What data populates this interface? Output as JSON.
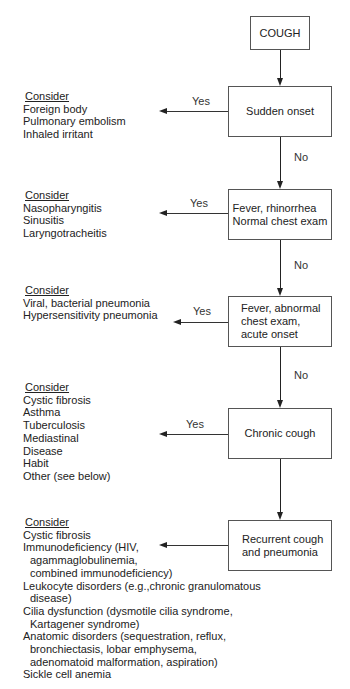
{
  "title": "COUGH",
  "nodes": [
    {
      "id": "cough",
      "label": "COUGH"
    },
    {
      "id": "sudden-onset",
      "label": "Sudden onset"
    },
    {
      "id": "fever-rhinorrhea",
      "label": "Fever, rhinorrhea\nNormal chest exam"
    },
    {
      "id": "fever-abnormal",
      "label": "Fever, abnormal\nchest  exam,\nacute onset"
    },
    {
      "id": "chronic-cough",
      "label": "Chronic cough"
    },
    {
      "id": "recurrent-cough",
      "label": "Recurrent cough\nand pneumonia"
    }
  ],
  "edge_labels": {
    "yes": "Yes",
    "no": "No"
  },
  "consider_groups": [
    {
      "heading": "Consider",
      "items": [
        "Foreign body",
        "Pulmonary embolism",
        "Inhaled irritant"
      ]
    },
    {
      "heading": "Consider",
      "items": [
        "Nasopharyngitis",
        "Sinusitis",
        "Laryngotracheitis"
      ]
    },
    {
      "heading": "Consider",
      "items": [
        "Viral, bacterial pneumonia",
        "Hypersensitivity pneumonia"
      ]
    },
    {
      "heading": "Consider",
      "items": [
        "Cystic fibrosis",
        "Asthma",
        "Tuberculosis",
        "Mediastinal",
        "Disease",
        "Habit",
        "Other (see below)"
      ]
    },
    {
      "heading": "Consider",
      "items": [
        "Cystic fibrosis",
        "Immunodeficiency (HIV,",
        "agammaglobulinemia,",
        "combined immunodeficiency)",
        "Leukocyte disorders (e.g.,chronic granulomatous",
        "disease)",
        "Cilia dysfunction (dysmotile cilia syndrome,",
        "Kartagener syndrome)",
        "Anatomic disorders (sequestration, reflux,",
        "bronchiectasis, lobar emphysema,",
        "adenomatoid malformation, aspiration)",
        "Sickle cell anemia"
      ]
    }
  ]
}
